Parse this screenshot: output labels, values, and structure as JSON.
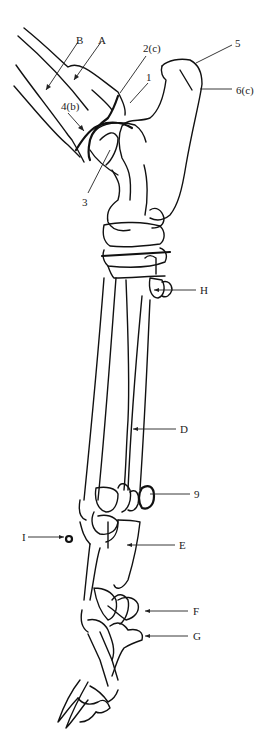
{
  "figure": {
    "type": "anatomical line drawing",
    "stroke_color": "#111111",
    "background": "#ffffff"
  },
  "labels": [
    {
      "id": "B",
      "text": "B",
      "x": 76,
      "y": 35
    },
    {
      "id": "A",
      "text": "A",
      "x": 98,
      "y": 35
    },
    {
      "id": "2c",
      "text": "2(c)",
      "x": 143,
      "y": 43
    },
    {
      "id": "1",
      "text": "1",
      "x": 146,
      "y": 72
    },
    {
      "id": "5",
      "text": "5",
      "x": 235,
      "y": 38
    },
    {
      "id": "6c",
      "text": "6(c)",
      "x": 236,
      "y": 85
    },
    {
      "id": "4b",
      "text": "4(b)",
      "x": 61,
      "y": 101
    },
    {
      "id": "3",
      "text": "3",
      "x": 82,
      "y": 197
    },
    {
      "id": "H",
      "text": "H",
      "x": 200,
      "y": 287
    },
    {
      "id": "D",
      "text": "D",
      "x": 180,
      "y": 426
    },
    {
      "id": "9",
      "text": "9",
      "x": 194,
      "y": 490
    },
    {
      "id": "I",
      "text": "I",
      "x": 22,
      "y": 532
    },
    {
      "id": "E",
      "text": "E",
      "x": 179,
      "y": 541
    },
    {
      "id": "F",
      "text": "F",
      "x": 193,
      "y": 607
    },
    {
      "id": "G",
      "text": "G",
      "x": 193,
      "y": 632
    }
  ]
}
